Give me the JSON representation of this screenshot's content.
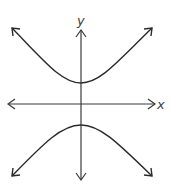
{
  "diagram": {
    "axes": {
      "x_label": "x",
      "y_label": "y"
    },
    "colors": {
      "background": "#ffffff",
      "stroke": "#2a2a2a"
    },
    "curves": [
      {
        "name": "upper-branch",
        "vertex": [
          81,
          83
        ],
        "ends": [
          [
            12,
            28
          ],
          [
            152,
            28
          ]
        ]
      },
      {
        "name": "lower-branch",
        "vertex": [
          81,
          125
        ],
        "ends": [
          [
            12,
            176
          ],
          [
            152,
            176
          ]
        ]
      }
    ]
  }
}
